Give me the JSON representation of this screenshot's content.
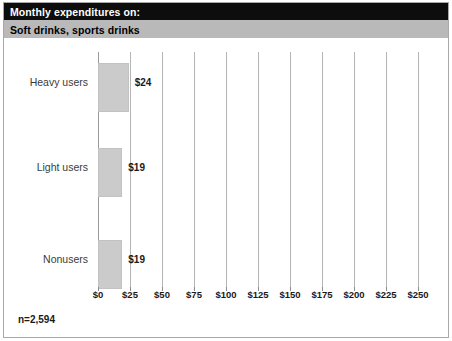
{
  "header": {
    "title": "Monthly expenditures on:",
    "subtitle": "Soft drinks, sports drinks",
    "title_bg": "#0d0d0d",
    "title_fg": "#ffffff",
    "subtitle_bg": "#b9b9b9",
    "subtitle_fg": "#000000"
  },
  "footnote": "n=2,594",
  "chart_data": {
    "type": "bar",
    "orientation": "horizontal",
    "title": "Monthly expenditures on:",
    "subtitle": "Soft drinks, sports drinks",
    "categories": [
      "Heavy users",
      "Light users",
      "Nonusers"
    ],
    "values": [
      24,
      19,
      19
    ],
    "value_labels": [
      "$24",
      "$19",
      "$19"
    ],
    "xlabel": "",
    "ylabel": "",
    "xlim": [
      0,
      250
    ],
    "xticks": [
      0,
      25,
      50,
      75,
      100,
      125,
      150,
      175,
      200,
      225,
      250
    ],
    "xtick_labels": [
      "$0",
      "$25",
      "$50",
      "$75",
      "$100",
      "$125",
      "$150",
      "$175",
      "$200",
      "$225",
      "$250"
    ],
    "grid": true,
    "grid_axis": "x",
    "legend": false,
    "bar_color": "#cbcbcb",
    "grid_color": "#b5b5b5",
    "note": "n=2,594"
  }
}
